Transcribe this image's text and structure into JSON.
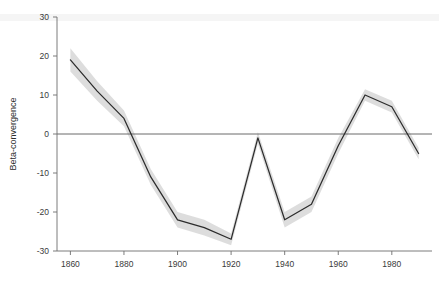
{
  "chart_data": {
    "type": "line",
    "title": "",
    "subtitle": "",
    "xlabel": "",
    "ylabel": "Beta-convergence",
    "x": [
      1860,
      1870,
      1880,
      1890,
      1900,
      1910,
      1920,
      1930,
      1940,
      1950,
      1960,
      1970,
      1980,
      1990
    ],
    "values": [
      19,
      11,
      4,
      -11,
      -22,
      -24,
      -27,
      -1,
      -22,
      -18,
      -3,
      10,
      7,
      -5
    ],
    "series": [
      {
        "name": "Beta-convergence",
        "values": [
          19,
          11,
          4,
          -11,
          -22,
          -24,
          -27,
          -1,
          -22,
          -18,
          -3,
          10,
          7,
          -5
        ],
        "ci_upper": [
          22,
          13.5,
          6,
          -9,
          -20,
          -22,
          -25.5,
          0.5,
          -20,
          -16,
          -1,
          11.5,
          8.5,
          -3.5
        ],
        "ci_lower": [
          16,
          8.5,
          2,
          -13,
          -24,
          -26,
          -28.5,
          -2.5,
          -24,
          -20,
          -5,
          8.5,
          5.5,
          -6.5
        ]
      }
    ],
    "xlim": [
      1855,
      1995
    ],
    "ylim": [
      -30,
      30
    ],
    "xticks": [
      1860,
      1880,
      1900,
      1920,
      1940,
      1960,
      1980
    ],
    "xtick_labels": [
      "1860",
      "1880",
      "1900",
      "1920",
      "1940",
      "1960",
      "1980"
    ],
    "yticks": [
      30,
      20,
      10,
      0,
      -10,
      -20,
      -30
    ],
    "ytick_labels": [
      "30",
      "20",
      "10",
      "0",
      "-10",
      "-20",
      "-30"
    ],
    "grid": false,
    "legend": null,
    "zero_reference_line": 0,
    "colors": {
      "line": "#2c2c2c",
      "confidence_band": "#d4d4d4",
      "axis": "#6e6e6e",
      "background": "#ffffff"
    }
  },
  "axis": {
    "y_title": "Beta-convergence"
  }
}
